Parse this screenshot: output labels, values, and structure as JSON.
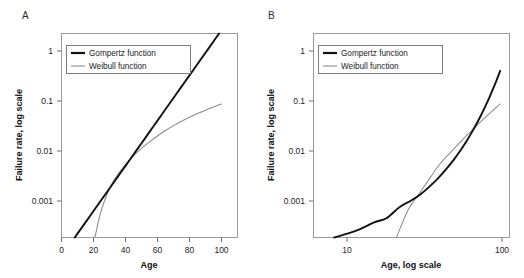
{
  "figure": {
    "background": "#ffffff",
    "gompertz_color": "#111111",
    "weibull_color": "#8c8c8c",
    "frame_color": "#9a9a9a",
    "caption_partial": ""
  },
  "panels": [
    {
      "letter": "A",
      "xlabel": "Age",
      "ylabel": "Failure rate, log scale",
      "xticks": [
        "0",
        "20",
        "40",
        "60",
        "80",
        "100"
      ],
      "yticks": [
        "1",
        "0.1",
        "0.01",
        "0.001"
      ],
      "legend": [
        {
          "label": "Gompertz function",
          "style": "gompertz"
        },
        {
          "label": "Weibull function",
          "style": "weibull"
        }
      ]
    },
    {
      "letter": "B",
      "xlabel": "Age, log scale",
      "ylabel": "Failure rate, log scale",
      "xticks": [
        "10",
        "100"
      ],
      "yticks": [
        "1",
        "0.1",
        "0.01",
        "0.001"
      ],
      "legend": [
        {
          "label": "Gompertz function",
          "style": "gompertz"
        },
        {
          "label": "Weibull function",
          "style": "weibull"
        }
      ]
    }
  ],
  "chart_data": [
    {
      "type": "line",
      "title": "A",
      "xlabel": "Age",
      "ylabel": "Failure rate, log scale",
      "xscale": "linear",
      "yscale": "log",
      "xlim": [
        0,
        110
      ],
      "ylim": [
        0.0002,
        2.0
      ],
      "xticks": [
        0,
        20,
        40,
        60,
        80,
        100
      ],
      "yticks": [
        0.001,
        0.01,
        0.1,
        1
      ],
      "grid": false,
      "legend_position": "upper-left",
      "series": [
        {
          "name": "Gompertz function",
          "color": "#111111",
          "x": [
            5,
            10,
            15,
            20,
            25,
            30,
            35,
            40,
            45,
            50,
            55,
            60,
            65,
            70,
            75,
            80,
            85,
            90,
            95,
            100
          ],
          "y": [
            0.000143,
            0.000238,
            0.000396,
            0.00066,
            0.0011,
            0.00183,
            0.00305,
            0.00508,
            0.00847,
            0.01411,
            0.02351,
            0.03918,
            0.06529,
            0.10881,
            0.18132,
            0.30215,
            0.50351,
            0.83899,
            1.39799,
            2.32959
          ]
        },
        {
          "name": "Weibull function",
          "color": "#8c8c8c",
          "x": [
            21,
            23,
            25,
            28,
            31,
            35,
            40,
            45,
            50,
            55,
            60,
            65,
            70,
            75,
            80,
            85,
            90,
            95,
            100
          ],
          "y": [
            0.000205,
            0.000405,
            0.0007,
            0.0013,
            0.0021,
            0.0034,
            0.0054,
            0.008,
            0.0112,
            0.015,
            0.0196,
            0.025,
            0.0312,
            0.038,
            0.0455,
            0.0538,
            0.0628,
            0.0725,
            0.083
          ]
        }
      ],
      "note": "Panel A uses a linear age axis; the Gompertz law is a straight line on the semi-log plot while the Weibull curve bends downward at older ages."
    },
    {
      "type": "line",
      "title": "B",
      "xlabel": "Age, log scale",
      "ylabel": "Failure rate, log scale",
      "xscale": "log",
      "yscale": "log",
      "xlim": [
        6,
        115
      ],
      "ylim": [
        0.0002,
        2.0
      ],
      "xticks": [
        10,
        100
      ],
      "yticks": [
        0.001,
        0.01,
        0.1,
        1
      ],
      "grid": false,
      "legend_position": "upper-left",
      "series": [
        {
          "name": "Gompertz function",
          "color": "#111111",
          "x": [
            7,
            8,
            10,
            12,
            15,
            18,
            22,
            26,
            30,
            35,
            40,
            45,
            50,
            55,
            60,
            65,
            70,
            75,
            80,
            85,
            90,
            95,
            100
          ],
          "y": [
            0.000181,
            0.000196,
            0.000238,
            0.000288,
            0.000396,
            0.000478,
            0.000795,
            0.001053,
            0.001395,
            0.00208,
            0.0031,
            0.00462,
            0.00688,
            0.01025,
            0.01528,
            0.02277,
            0.03392,
            0.05055,
            0.07532,
            0.11223,
            0.16723,
            0.24917,
            0.37128
          ]
        },
        {
          "name": "Weibull function",
          "color": "#8c8c8c",
          "x": [
            21,
            25,
            30,
            35,
            40,
            50,
            60,
            70,
            80,
            90,
            100
          ],
          "y": [
            0.000205,
            0.0007,
            0.00156,
            0.00305,
            0.0054,
            0.0112,
            0.0196,
            0.0312,
            0.0455,
            0.0628,
            0.083
          ]
        }
      ],
      "note": "Panel B uses a logarithmic age axis; the Weibull power law becomes a straight line on the log-log plot while the Gompertz curve bends upward."
    }
  ]
}
